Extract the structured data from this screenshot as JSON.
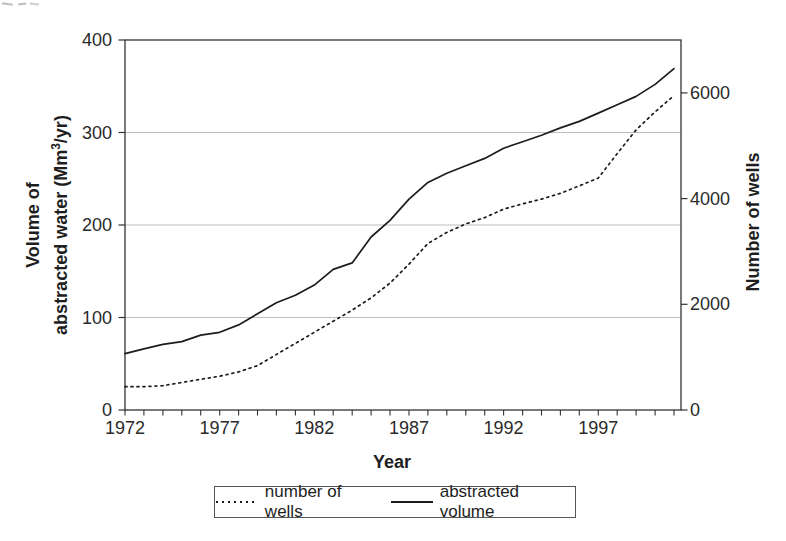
{
  "figure": {
    "x_axis_title": "Year",
    "left_axis_title_line1": "Volume of",
    "left_axis_title_line2_pre": "abstracted water (Mm",
    "left_axis_title_sup": "3",
    "left_axis_title_line2_post": "/yr)",
    "right_axis_title": "Number of wells"
  },
  "legend": {
    "wells_label": "number of wells",
    "volume_label": "abstracted volume"
  },
  "chart_data": {
    "type": "line",
    "title": "",
    "xlabel": "Year",
    "x": [
      1972,
      1973,
      1974,
      1975,
      1976,
      1977,
      1978,
      1979,
      1980,
      1981,
      1982,
      1983,
      1984,
      1985,
      1986,
      1987,
      1988,
      1989,
      1990,
      1991,
      1992,
      1993,
      1994,
      1995,
      1996,
      1997,
      1998,
      1999,
      2000,
      2001
    ],
    "series": [
      {
        "name": "number of wells",
        "axis": "right",
        "style": "dotted",
        "values": [
          440,
          440,
          460,
          520,
          580,
          640,
          720,
          840,
          1050,
          1260,
          1470,
          1680,
          1890,
          2120,
          2400,
          2760,
          3150,
          3360,
          3520,
          3640,
          3800,
          3900,
          3990,
          4100,
          4240,
          4390,
          4850,
          5300,
          5640,
          5950
        ]
      },
      {
        "name": "abstracted volume",
        "axis": "left",
        "style": "solid",
        "values": [
          61,
          66,
          71,
          74,
          81,
          84,
          92,
          104,
          116,
          124,
          135,
          152,
          159,
          187,
          205,
          228,
          246,
          256,
          264,
          272,
          283,
          290,
          297,
          305,
          312,
          321,
          330,
          339,
          352,
          369
        ]
      }
    ],
    "left_axis": {
      "title": "Volume of abstracted water (Mm3/yr)",
      "range": [
        0,
        400
      ],
      "ticks": [
        0,
        100,
        200,
        300,
        400
      ]
    },
    "right_axis": {
      "title": "Number of wells",
      "range": [
        0,
        7000
      ],
      "ticks": [
        0,
        2000,
        4000,
        6000
      ]
    },
    "x_axis": {
      "title": "Year",
      "range": [
        1972,
        2001
      ],
      "labeled_ticks": [
        1972,
        1977,
        1982,
        1987,
        1992,
        1997
      ],
      "minor_tick_interval_years": 1
    },
    "gridlines_at_left_values": [
      100,
      200,
      300
    ],
    "legend": {
      "position": "bottom",
      "entries": [
        "number of wells",
        "abstracted volume"
      ]
    },
    "line_color": "#1c1c1c",
    "grid_color": "#b5b5b5",
    "axis_color": "#333333"
  }
}
